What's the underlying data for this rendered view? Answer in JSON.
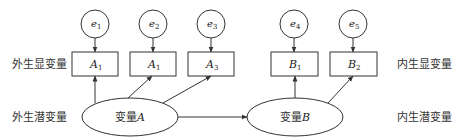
{
  "row_labels": {
    "exogenous_observed": "外生显变量",
    "exogenous_latent": "外生潜变量",
    "endogenous_observed": "内生显变量",
    "endogenous_latent": "内生潜变量"
  },
  "errors": [
    {
      "base": "e",
      "sub": "1"
    },
    {
      "base": "e",
      "sub": "2"
    },
    {
      "base": "e",
      "sub": "3"
    },
    {
      "base": "e",
      "sub": "4"
    },
    {
      "base": "e",
      "sub": "5"
    }
  ],
  "observed": [
    {
      "base": "A",
      "sub": "1"
    },
    {
      "base": "A",
      "sub": "1"
    },
    {
      "base": "A",
      "sub": "3"
    },
    {
      "base": "B",
      "sub": "1"
    },
    {
      "base": "B",
      "sub": "2"
    }
  ],
  "latent": [
    {
      "prefix": "变量",
      "var": "A"
    },
    {
      "prefix": "变量",
      "var": "B"
    }
  ],
  "colors": {
    "stroke": "#333333",
    "background": "#ffffff"
  }
}
